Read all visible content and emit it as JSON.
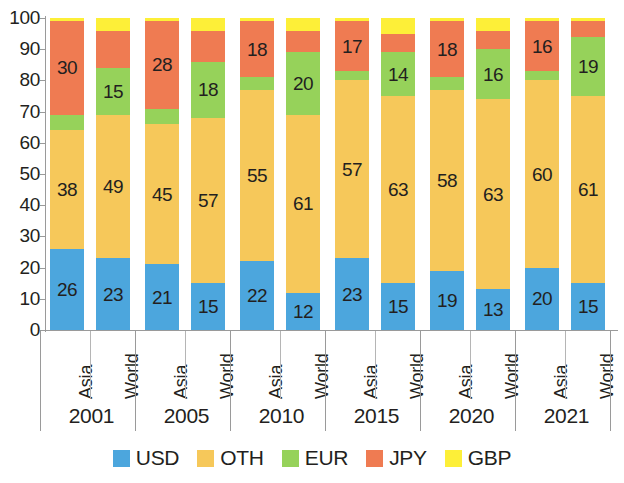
{
  "chart_data": {
    "type": "bar",
    "subtype": "stacked-vertical-percent",
    "title": "",
    "xlabel": "",
    "ylabel": "",
    "ylim": [
      0,
      100
    ],
    "ytick_labels": [
      "0",
      "10",
      "20",
      "30",
      "40",
      "50",
      "60",
      "70",
      "80",
      "90",
      "100"
    ],
    "ytick_values": [
      0,
      10,
      20,
      30,
      40,
      50,
      60,
      70,
      80,
      90,
      100
    ],
    "grid": false,
    "legend_position": "bottom",
    "categories": [
      "2001 Asia",
      "2001 World",
      "2005 Asia",
      "2005 World",
      "2010 Asia",
      "2010 World",
      "2015 Asia",
      "2015 World",
      "2020 Asia",
      "2020 World",
      "2021 Asia",
      "2021 World"
    ],
    "groups": [
      {
        "year": "2001",
        "regions": [
          "Asia",
          "World"
        ]
      },
      {
        "year": "2005",
        "regions": [
          "Asia",
          "World"
        ]
      },
      {
        "year": "2010",
        "regions": [
          "Asia",
          "World"
        ]
      },
      {
        "year": "2015",
        "regions": [
          "Asia",
          "World"
        ]
      },
      {
        "year": "2020",
        "regions": [
          "Asia",
          "World"
        ]
      },
      {
        "year": "2021",
        "regions": [
          "Asia",
          "World"
        ]
      }
    ],
    "series": [
      {
        "name": "USD",
        "color": "#4ca6dd",
        "values": [
          26,
          23,
          21,
          15,
          22,
          12,
          23,
          15,
          19,
          13,
          20,
          15
        ]
      },
      {
        "name": "OTH",
        "color": "#f5c košt"
      }
    ],
    "stack_order_bottom_to_top": [
      "USD",
      "OTH",
      "EUR",
      "JPY",
      "GBP"
    ],
    "bars": [
      {
        "category": "2001 Asia",
        "USD": 26,
        "OTH": 38,
        "EUR": 5,
        "JPY": 30,
        "GBP": 1,
        "labels": {
          "USD": "26",
          "OTH": "38",
          "EUR": "",
          "JPY": "30",
          "GBP": ""
        }
      },
      {
        "category": "2001 World",
        "USD": 23,
        "OTH": 46,
        "EUR": 15,
        "JPY": 12,
        "GBP": 4,
        "labels": {
          "USD": "23",
          "OTH": "49",
          "EUR": "15",
          "JPY": "",
          "GBP": ""
        }
      },
      {
        "category": "2005 Asia",
        "USD": 21,
        "OTH": 45,
        "EUR": 5,
        "JPY": 28,
        "GBP": 1,
        "labels": {
          "USD": "21",
          "OTH": "45",
          "EUR": "",
          "JPY": "28",
          "GBP": ""
        }
      },
      {
        "category": "2005 World",
        "USD": 15,
        "OTH": 53,
        "EUR": 18,
        "JPY": 10,
        "GBP": 4,
        "labels": {
          "USD": "15",
          "OTH": "57",
          "EUR": "18",
          "JPY": "",
          "GBP": ""
        }
      },
      {
        "category": "2010 Asia",
        "USD": 22,
        "OTH": 55,
        "EUR": 4,
        "JPY": 18,
        "GBP": 1,
        "labels": {
          "USD": "22",
          "OTH": "55",
          "EUR": "",
          "JPY": "18",
          "GBP": ""
        }
      },
      {
        "category": "2010 World",
        "USD": 12,
        "OTH": 57,
        "EUR": 20,
        "JPY": 7,
        "GBP": 4,
        "labels": {
          "USD": "12",
          "OTH": "61",
          "EUR": "20",
          "JPY": "",
          "GBP": ""
        }
      },
      {
        "category": "2015 Asia",
        "USD": 23,
        "OTH": 57,
        "EUR": 3,
        "JPY": 16,
        "GBP": 1,
        "labels": {
          "USD": "23",
          "OTH": "57",
          "EUR": "",
          "JPY": "17",
          "GBP": ""
        }
      },
      {
        "category": "2015 World",
        "USD": 15,
        "OTH": 60,
        "EUR": 14,
        "JPY": 6,
        "GBP": 5,
        "labels": {
          "USD": "15",
          "OTH": "63",
          "EUR": "14",
          "JPY": "",
          "GBP": ""
        }
      },
      {
        "category": "2020 Asia",
        "USD": 19,
        "OTH": 58,
        "EUR": 4,
        "JPY": 18,
        "GBP": 1,
        "labels": {
          "USD": "19",
          "OTH": "58",
          "EUR": "",
          "JPY": "18",
          "GBP": ""
        }
      },
      {
        "category": "2020 World",
        "USD": 13,
        "OTH": 61,
        "EUR": 16,
        "JPY": 6,
        "GBP": 4,
        "labels": {
          "USD": "13",
          "OTH": "63",
          "EUR": "16",
          "JPY": "",
          "GBP": ""
        }
      },
      {
        "category": "2021 Asia",
        "USD": 20,
        "OTH": 60,
        "EUR": 3,
        "JPY": 16,
        "GBP": 1,
        "labels": {
          "USD": "20",
          "OTH": "60",
          "EUR": "",
          "JPY": "16",
          "GBP": ""
        }
      },
      {
        "category": "2021 World",
        "USD": 15,
        "OTH": 60,
        "EUR": 19,
        "JPY": 5,
        "GBP": 1,
        "labels": {
          "USD": "15",
          "OTH": "61",
          "EUR": "19",
          "JPY": "",
          "GBP": ""
        }
      }
    ],
    "legend": [
      {
        "label": "USD",
        "color": "#4ca6dd"
      },
      {
        "label": "OTH",
        "color": "#f6c85a"
      },
      {
        "label": "EUR",
        "color": "#96d25a"
      },
      {
        "label": "JPY",
        "color": "#ef7b52"
      },
      {
        "label": "GBP",
        "color": "#fdef38"
      }
    ],
    "colors": {
      "USD": "#4ca6dd",
      "OTH": "#f6c85a",
      "EUR": "#96d25a",
      "JPY": "#ef7b52",
      "GBP": "#fdef38",
      "axis": "#9a9a9a",
      "text": "#231f20",
      "background": "#ffffff"
    }
  }
}
